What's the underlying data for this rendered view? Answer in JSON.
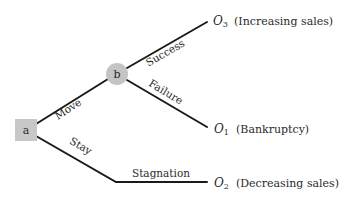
{
  "diagram": {
    "type": "decision-tree",
    "colors": {
      "line": "#1a1a1a",
      "decision_node_fill": "#c8c8c8",
      "chance_node_fill": "#c4c4c4",
      "text": "#2a2a2a"
    },
    "nodes": {
      "decision": {
        "id": "a",
        "label": "a",
        "shape": "square"
      },
      "chance": {
        "id": "b",
        "label": "b",
        "shape": "circle"
      }
    },
    "edges": {
      "move": {
        "from": "a",
        "to": "b",
        "label": "Move"
      },
      "stay": {
        "from": "a",
        "to": "O2",
        "label": "Stay"
      },
      "success": {
        "from": "b",
        "to": "O3",
        "label": "Success"
      },
      "failure": {
        "from": "b",
        "to": "O1",
        "label": "Failure"
      },
      "stagnation": {
        "from": "a",
        "to": "O2",
        "label": "Stagnation"
      }
    },
    "outcomes": {
      "o3": {
        "symbol": "O",
        "subscript": "3",
        "description": "(Increasing sales)"
      },
      "o1": {
        "symbol": "O",
        "subscript": "1",
        "description": "(Bankruptcy)"
      },
      "o2": {
        "symbol": "O",
        "subscript": "2",
        "description": "(Decreasing sales)"
      }
    }
  }
}
